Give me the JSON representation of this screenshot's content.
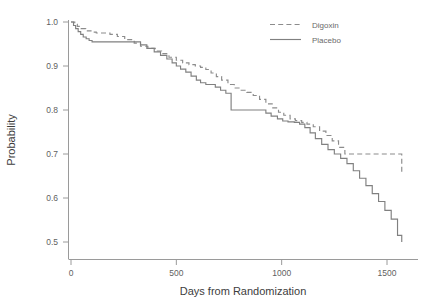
{
  "chart_data": {
    "type": "line",
    "title": "",
    "subtitle": "",
    "xlabel": "Days from Randomization",
    "ylabel": "Probability",
    "xlim": [
      0,
      1600
    ],
    "ylim": [
      0.46,
      1.02
    ],
    "xticks": [
      0,
      500,
      1000,
      1500
    ],
    "xticklabels": [
      "0",
      "500",
      "1000",
      "1500"
    ],
    "yticks": [
      0.5,
      0.6,
      0.7,
      0.8,
      0.9,
      1.0
    ],
    "yticklabels": [
      "0.5",
      "0.6",
      "0.7",
      "0.8",
      "0.9",
      "1.0"
    ],
    "grid": false,
    "legend_position": "top-right",
    "step_style": "post",
    "line_color": "#808080",
    "series": [
      {
        "name": "Digoxin",
        "style": "dashed",
        "color": "#8c8c8c",
        "x": [
          0,
          18,
          30,
          48,
          70,
          95,
          120,
          150,
          185,
          220,
          255,
          300,
          330,
          365,
          400,
          430,
          465,
          500,
          530,
          560,
          590,
          615,
          640,
          665,
          690,
          715,
          745,
          775,
          805,
          835,
          865,
          895,
          925,
          955,
          985,
          1010,
          1040,
          1065,
          1095,
          1120,
          1150,
          1180,
          1210,
          1240,
          1270,
          1300,
          1570
        ],
        "y": [
          1.0,
          0.995,
          0.99,
          0.985,
          0.98,
          0.977,
          0.975,
          0.975,
          0.972,
          0.967,
          0.96,
          0.952,
          0.945,
          0.94,
          0.934,
          0.928,
          0.92,
          0.913,
          0.907,
          0.903,
          0.9,
          0.897,
          0.892,
          0.884,
          0.876,
          0.868,
          0.858,
          0.85,
          0.845,
          0.84,
          0.833,
          0.824,
          0.814,
          0.805,
          0.795,
          0.788,
          0.78,
          0.776,
          0.772,
          0.768,
          0.762,
          0.752,
          0.742,
          0.73,
          0.715,
          0.7,
          0.655
        ]
      },
      {
        "name": "Placebo",
        "style": "solid",
        "color": "#808080",
        "x": [
          0,
          12,
          22,
          34,
          46,
          58,
          72,
          86,
          100,
          300,
          330,
          360,
          395,
          425,
          455,
          480,
          500,
          520,
          545,
          570,
          595,
          615,
          640,
          660,
          685,
          710,
          735,
          760,
          900,
          925,
          950,
          980,
          1005,
          1030,
          1060,
          1085,
          1110,
          1135,
          1160,
          1190,
          1220,
          1250,
          1280,
          1310,
          1340,
          1370,
          1400,
          1430,
          1460,
          1490,
          1520,
          1550,
          1570
        ],
        "y": [
          1.0,
          0.992,
          0.985,
          0.978,
          0.972,
          0.966,
          0.962,
          0.958,
          0.955,
          0.955,
          0.948,
          0.94,
          0.932,
          0.924,
          0.916,
          0.907,
          0.9,
          0.893,
          0.886,
          0.877,
          0.868,
          0.862,
          0.858,
          0.858,
          0.852,
          0.845,
          0.838,
          0.8,
          0.8,
          0.793,
          0.786,
          0.78,
          0.775,
          0.773,
          0.772,
          0.768,
          0.76,
          0.748,
          0.735,
          0.722,
          0.71,
          0.7,
          0.69,
          0.678,
          0.662,
          0.645,
          0.628,
          0.61,
          0.592,
          0.572,
          0.552,
          0.515,
          0.5
        ]
      }
    ],
    "annotations": []
  },
  "legend": {
    "entries": [
      {
        "label": "Digoxin",
        "style": "dashed"
      },
      {
        "label": "Placebo",
        "style": "solid"
      }
    ]
  },
  "axes": {
    "x_title": "Days from Randomization",
    "y_title": "Probability"
  }
}
